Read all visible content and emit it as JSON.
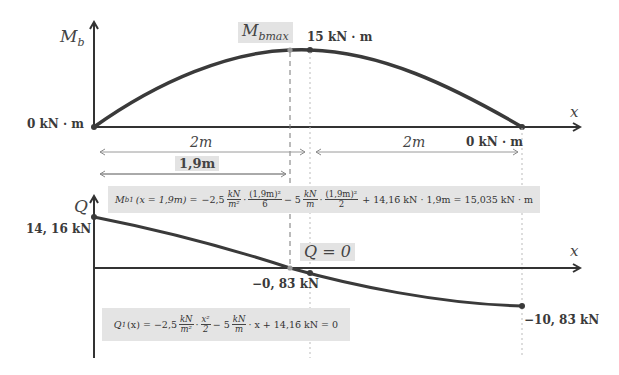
{
  "moment_diagram": {
    "axis_label": "M",
    "axis_label_sub": "b",
    "x_axis_label": "x",
    "max_label": "M",
    "max_label_sub": "bmax",
    "max_value_label": "15 kN · m",
    "left_value_label": "0 kN · m",
    "right_value_label": "0 kN · m",
    "dim_left": "2m",
    "dim_right": "2m",
    "dim_max_position": "1,9m"
  },
  "moment_formula": {
    "lhs": "M",
    "lhs_sub": "b1",
    "lhs_arg": "(x = 1,9m) =",
    "term1_coef": "−2,5",
    "term1_unit_num": "kN",
    "term1_unit_den": "m²",
    "term1_frac_num": "(1,9m)²",
    "term1_frac_den": "6",
    "term2_coef": "− 5",
    "term2_unit_num": "kN",
    "term2_unit_den": "m",
    "term2_frac_num": "(1,9m)²",
    "term2_frac_den": "2",
    "term3": "+ 14,16̄ kN · 1,9m = 15,035 kN · m"
  },
  "shear_diagram": {
    "axis_label": "Q",
    "x_axis_label": "x",
    "left_value_label": "14, 16̄ kN",
    "zero_label": "Q = 0",
    "mid_value_label": "−0, 83̄ kN",
    "right_value_label": "−10, 83̄ kN"
  },
  "shear_formula": {
    "lhs": "Q",
    "lhs_sub": "1",
    "lhs_arg": "(x) = −2,5",
    "term1_unit_num": "kN",
    "term1_unit_den": "m²",
    "term1_frac_num": "x²",
    "term1_frac_den": "2",
    "term2_coef": "− 5",
    "term2_unit_num": "kN",
    "term2_unit_den": "m",
    "term3": "· x + 14,16̄ kN = 0"
  },
  "colors": {
    "curve": "#3a3a3a",
    "axis": "#333333",
    "highlight_box": "#e3e3e3",
    "dim_line": "#9a9a9a"
  }
}
